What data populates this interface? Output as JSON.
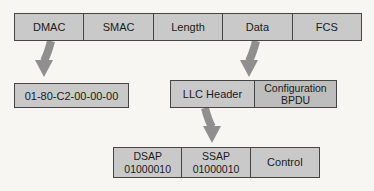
{
  "diagram_title": "Ethernet frame with BPDU detail",
  "frame": {
    "fields": [
      {
        "label": "DMAC"
      },
      {
        "label": "SMAC"
      },
      {
        "label": "Length"
      },
      {
        "label": "Data"
      },
      {
        "label": "FCS"
      }
    ]
  },
  "dmac_detail": {
    "value": "01-80-C2-00-00-00"
  },
  "data_detail": {
    "llc_header": {
      "label": "LLC Header"
    },
    "bpdu": {
      "line1": "Configuration",
      "line2": "BPDU"
    }
  },
  "llc_detail": {
    "dsap": {
      "line1": "DSAP",
      "line2": "01000010"
    },
    "ssap": {
      "line1": "SSAP",
      "line2": "01000010"
    },
    "control": {
      "label": "Control"
    }
  },
  "icons": {
    "arrow_dmac": "curved-down-arrow",
    "arrow_data": "curved-down-arrow",
    "arrow_llc": "curved-down-arrow"
  },
  "colors": {
    "box_fill": "#c9c9c9",
    "box_fill_dark": "#bdbdbd",
    "box_border": "#454545",
    "arrow_fill": "#8f8f8f",
    "background": "#f7f6f3",
    "text": "#1b1b1b"
  }
}
